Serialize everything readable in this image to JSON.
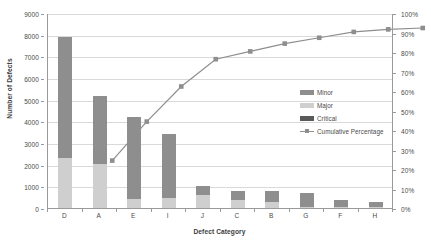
{
  "chart_data": {
    "type": "bar",
    "title": "",
    "subtitle": "",
    "xlabel": "Defect Category",
    "ylabel": "Number of Defects",
    "y2label": "",
    "categories": [
      "D",
      "A",
      "E",
      "I",
      "J",
      "C",
      "B",
      "G",
      "F",
      "H"
    ],
    "ylim": [
      0,
      9000
    ],
    "y2lim": [
      0,
      100
    ],
    "y_ticks": [
      "0",
      "1000",
      "2000",
      "3000",
      "4000",
      "5000",
      "6000",
      "7000",
      "8000",
      "9000"
    ],
    "y2_ticks": [
      "0%",
      "10%",
      "20%",
      "30%",
      "40%",
      "50%",
      "60%",
      "70%",
      "80%",
      "90%",
      "100%"
    ],
    "grid": true,
    "legend_position": "middle-right",
    "stacked": true,
    "series": [
      {
        "name": "Major",
        "color": "#cfcfcf",
        "values": [
          2300,
          2050,
          400,
          450,
          600,
          350,
          300,
          60,
          40,
          30
        ]
      },
      {
        "name": "Minor",
        "color": "#8e8e8e",
        "values": [
          5600,
          3100,
          3800,
          2970,
          400,
          450,
          490,
          620,
          350,
          230
        ]
      },
      {
        "name": "Critical",
        "color": "#5a5a5a",
        "values": [
          0,
          0,
          0,
          0,
          0,
          0,
          0,
          0,
          0,
          0
        ]
      }
    ],
    "line_series": {
      "name": "Cumulative Percentage",
      "color": "#8e8e8e",
      "marker": "square",
      "values": [
        32,
        52,
        70,
        84,
        88,
        92,
        95,
        98,
        99.3,
        100
      ]
    },
    "totals": [
      7900,
      5150,
      4200,
      3420,
      1000,
      800,
      790,
      680,
      390,
      260
    ]
  },
  "legend": {
    "entries": [
      {
        "label": "Minor",
        "swatch": "#8e8e8e",
        "kind": "bar"
      },
      {
        "label": "Major",
        "swatch": "#cfcfcf",
        "kind": "bar"
      },
      {
        "label": "Critical",
        "swatch": "#5a5a5a",
        "kind": "bar"
      },
      {
        "label": "Cumulative Percentage",
        "swatch": "#8e8e8e",
        "kind": "line"
      }
    ]
  },
  "colors": {
    "minor": "#8e8e8e",
    "major": "#cfcfcf",
    "critical": "#5a5a5a",
    "line": "#8e8e8e",
    "grid": "#d9d9d9",
    "axis": "#9a9a9a",
    "text": "#4a4a4a",
    "background": "#ffffff"
  }
}
